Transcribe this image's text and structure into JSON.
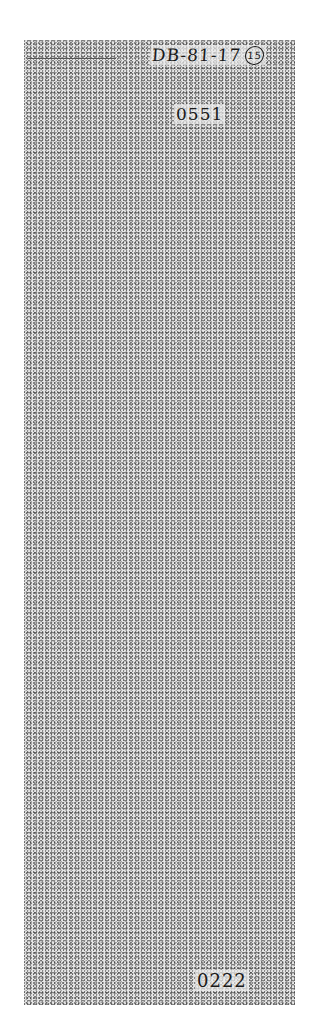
{
  "document": {
    "handwritten_id": "DB-81-17",
    "circled_number": "15",
    "top_number": "0551",
    "bottom_number": "0222",
    "body_text": ""
  }
}
